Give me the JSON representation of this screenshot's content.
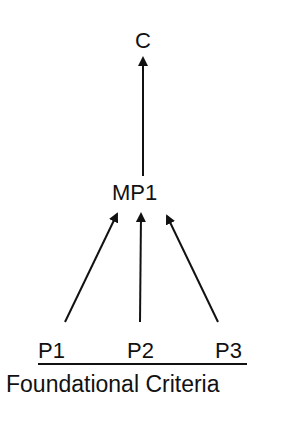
{
  "nodes": {
    "conclusion": "C",
    "mid": "MP1",
    "premises": [
      "P1",
      "P2",
      "P3"
    ]
  },
  "base_label": "Foundational Criteria",
  "edges": [
    {
      "from": "P1",
      "to": "MP1"
    },
    {
      "from": "P2",
      "to": "MP1"
    },
    {
      "from": "P3",
      "to": "MP1"
    },
    {
      "from": "MP1",
      "to": "C"
    }
  ]
}
